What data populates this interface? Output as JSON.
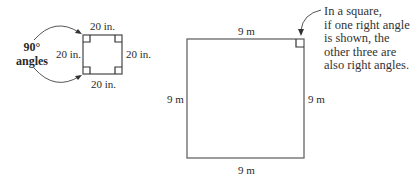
{
  "diagram": {
    "small_square": {
      "side_top": "20 in.",
      "side_left": "20 in.",
      "side_right": "20 in.",
      "side_bottom": "20 in.",
      "callout_line1": "90°",
      "callout_line2": "angles"
    },
    "large_square": {
      "side_top": "9 m",
      "side_left": "9 m",
      "side_right": "9 m",
      "side_bottom": "9 m"
    },
    "note": {
      "lines": [
        "In a square,",
        "if one right angle",
        "is shown, the",
        "other three are",
        "also right angles."
      ]
    },
    "colors": {
      "stroke": "#555555",
      "text": "#2a2a2a"
    }
  }
}
